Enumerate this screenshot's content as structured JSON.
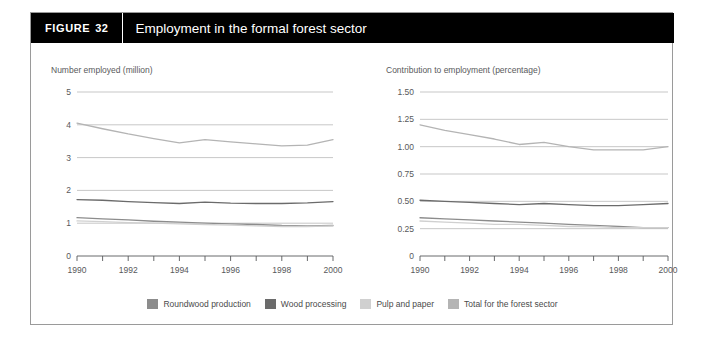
{
  "figure": {
    "tag_label": "FIGURE",
    "number": "32",
    "title": "Employment in the formal forest sector"
  },
  "legend": {
    "items": [
      {
        "label": "Roundwood production",
        "color": "#8c8c8c"
      },
      {
        "label": "Wood processing",
        "color": "#6b6b6b"
      },
      {
        "label": "Pulp and paper",
        "color": "#d0d0d0"
      },
      {
        "label": "Total for the forest sector",
        "color": "#b4b4b4"
      }
    ]
  },
  "chart_data": [
    {
      "type": "line",
      "title": "Number employed (million)",
      "xlabel": "",
      "ylabel": "Number employed (million)",
      "x": [
        1990,
        1991,
        1992,
        1993,
        1994,
        1995,
        1996,
        1997,
        1998,
        1999,
        2000
      ],
      "xlim": [
        1990,
        2000
      ],
      "xticks": [
        1990,
        1991,
        1992,
        1993,
        1994,
        1995,
        1996,
        1997,
        1998,
        1999,
        2000
      ],
      "xticklabels": [
        "1990",
        "",
        "1992",
        "",
        "1994",
        "",
        "1996",
        "",
        "1998",
        "",
        "2000"
      ],
      "ylim": [
        0,
        5
      ],
      "yticks": [
        0,
        1,
        2,
        3,
        4,
        5
      ],
      "yticklabels": [
        "0",
        "1",
        "2",
        "3",
        "4",
        "5"
      ],
      "grid": true,
      "legend_position": "bottom",
      "series": [
        {
          "name": "Total for the forest sector",
          "color": "#b4b4b4",
          "values": [
            4.05,
            3.88,
            3.72,
            3.58,
            3.45,
            3.55,
            3.48,
            3.42,
            3.36,
            3.38,
            3.55
          ]
        },
        {
          "name": "Wood processing",
          "color": "#6b6b6b",
          "values": [
            1.72,
            1.7,
            1.66,
            1.63,
            1.6,
            1.64,
            1.61,
            1.6,
            1.6,
            1.62,
            1.66
          ]
        },
        {
          "name": "Roundwood production",
          "color": "#8c8c8c",
          "values": [
            1.17,
            1.13,
            1.1,
            1.06,
            1.03,
            1.0,
            0.98,
            0.96,
            0.93,
            0.92,
            0.93
          ]
        },
        {
          "name": "Pulp and paper",
          "color": "#d0d0d0",
          "values": [
            1.07,
            1.05,
            1.02,
            1.0,
            0.98,
            0.96,
            0.94,
            0.92,
            0.9,
            0.9,
            0.92
          ]
        }
      ]
    },
    {
      "type": "line",
      "title": "Contribution to employment (percentage)",
      "xlabel": "",
      "ylabel": "Contribution to employment (percentage)",
      "x": [
        1990,
        1991,
        1992,
        1993,
        1994,
        1995,
        1996,
        1997,
        1998,
        1999,
        2000
      ],
      "xlim": [
        1990,
        2000
      ],
      "xticks": [
        1990,
        1991,
        1992,
        1993,
        1994,
        1995,
        1996,
        1997,
        1998,
        1999,
        2000
      ],
      "xticklabels": [
        "1990",
        "",
        "1992",
        "",
        "1994",
        "",
        "1996",
        "",
        "1998",
        "",
        "2000"
      ],
      "ylim": [
        0,
        1.5
      ],
      "yticks": [
        0,
        0.25,
        0.5,
        0.75,
        1.0,
        1.25,
        1.5
      ],
      "yticklabels": [
        "0",
        "0.25",
        "0.50",
        "0.75",
        "1.00",
        "1.25",
        "1.50"
      ],
      "grid": true,
      "legend_position": "bottom",
      "series": [
        {
          "name": "Total for the forest sector",
          "color": "#b4b4b4",
          "values": [
            1.2,
            1.15,
            1.11,
            1.07,
            1.02,
            1.04,
            1.0,
            0.97,
            0.97,
            0.97,
            1.0
          ]
        },
        {
          "name": "Wood processing",
          "color": "#6b6b6b",
          "values": [
            0.51,
            0.5,
            0.49,
            0.48,
            0.47,
            0.48,
            0.47,
            0.46,
            0.46,
            0.47,
            0.48
          ]
        },
        {
          "name": "Roundwood production",
          "color": "#8c8c8c",
          "values": [
            0.35,
            0.34,
            0.33,
            0.32,
            0.31,
            0.3,
            0.29,
            0.28,
            0.27,
            0.26,
            0.26
          ]
        },
        {
          "name": "Pulp and paper",
          "color": "#d0d0d0",
          "values": [
            0.32,
            0.31,
            0.3,
            0.29,
            0.29,
            0.28,
            0.27,
            0.27,
            0.26,
            0.26,
            0.26
          ]
        }
      ]
    }
  ]
}
